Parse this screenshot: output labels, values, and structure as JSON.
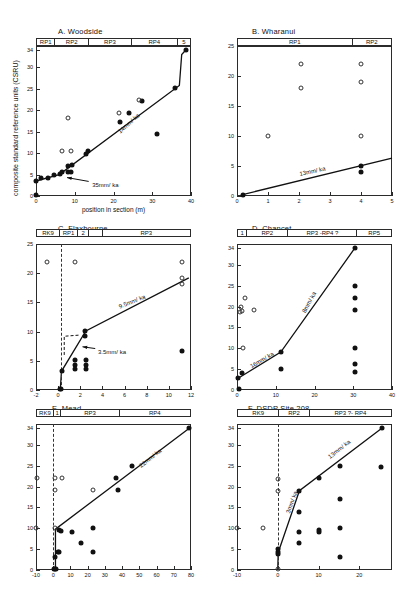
{
  "figure": {
    "axis": {
      "ylabel": "composite standard reference units (CSRU)",
      "xlabel": "position in section  (m)"
    }
  },
  "panels": [
    {
      "id": "A",
      "title": "A.  Woodside",
      "zones": [
        {
          "label": "RP1",
          "w": 12
        },
        {
          "label": "RP2",
          "w": 22
        },
        {
          "label": "RP3",
          "w": 28
        },
        {
          "label": "RP4",
          "w": 30
        },
        {
          "label": "5",
          "w": 8
        }
      ],
      "xlim": [
        0,
        40
      ],
      "ylim": [
        0,
        35
      ],
      "xticks": [
        0,
        10,
        20,
        30,
        40
      ],
      "yticks": [
        0,
        5,
        10,
        15,
        20,
        25,
        30,
        34
      ],
      "ytick_labels": [
        "0",
        "5",
        "10",
        "15",
        "20",
        "25",
        "30",
        "34"
      ],
      "rates": [
        {
          "label": "14mm/ ka",
          "x": 21,
          "y": 15.5,
          "rot": -42
        },
        {
          "label": "35mm/ ka",
          "x": 14.5,
          "y": 3.2,
          "rot": 0
        }
      ],
      "arrow": {
        "from": [
          13.6,
          3.4
        ],
        "to": [
          8.0,
          4.3
        ]
      },
      "fit": [
        [
          0,
          3.5
        ],
        [
          6,
          5.0
        ],
        [
          37,
          25.8
        ],
        [
          37.6,
          33.0
        ],
        [
          38.6,
          34.0
        ]
      ],
      "solid": [
        [
          0,
          0.2
        ],
        [
          0,
          3.5
        ],
        [
          1.2,
          4.2
        ],
        [
          3.2,
          4.3
        ],
        [
          4.6,
          4.8
        ],
        [
          6.2,
          5.2
        ],
        [
          6.8,
          5.5
        ],
        [
          8.2,
          5.6
        ],
        [
          9.0,
          5.5
        ],
        [
          8.3,
          7.1
        ],
        [
          9.3,
          7.3
        ],
        [
          12.8,
          9.7
        ],
        [
          13.3,
          10.4
        ],
        [
          21.8,
          17.2
        ],
        [
          24.0,
          19.3
        ],
        [
          27.4,
          22.2
        ],
        [
          31.3,
          14.4
        ],
        [
          35.9,
          25.3
        ],
        [
          38.6,
          34.0
        ]
      ],
      "open": [
        [
          8.2,
          18.2
        ],
        [
          6.8,
          10.4
        ],
        [
          9.0,
          10.4
        ],
        [
          21.5,
          19.3
        ],
        [
          26.6,
          22.3
        ]
      ]
    },
    {
      "id": "B",
      "title": "B.  Wharanui",
      "zones": [
        {
          "label": "RP1",
          "w": 75
        },
        {
          "label": "RP2",
          "w": 25
        }
      ],
      "xlim": [
        0,
        5
      ],
      "ylim": [
        0,
        25
      ],
      "xticks": [
        0,
        1,
        2,
        3,
        4,
        5
      ],
      "yticks": [
        0,
        5,
        10,
        15,
        20,
        25
      ],
      "ytick_labels": [
        "0",
        "5",
        "10",
        "15",
        "20",
        "25"
      ],
      "rates": [
        {
          "label": "13mm/ ka",
          "x": 2.0,
          "y": 4.2,
          "rot": -12
        }
      ],
      "fit": [
        [
          0.15,
          0.2
        ],
        [
          5.0,
          6.3
        ]
      ],
      "solid": [
        [
          0.18,
          0.2
        ],
        [
          4.0,
          5.0
        ],
        [
          4.0,
          4.0
        ]
      ],
      "open": [
        [
          2.05,
          22.0
        ],
        [
          2.05,
          18.0
        ],
        [
          1.0,
          10.0
        ],
        [
          4.0,
          22.0
        ],
        [
          4.0,
          19.0
        ],
        [
          4.0,
          10.0
        ]
      ]
    },
    {
      "id": "C",
      "title": "C.  Flaxbourne",
      "zones": [
        {
          "label": "RK9",
          "w": 15
        },
        {
          "label": "RP1",
          "w": 12
        },
        {
          "label": "2",
          "w": 7
        },
        {
          "label": "",
          "w": 9
        },
        {
          "label": "RP3",
          "w": 57
        }
      ],
      "xlim": [
        -2,
        12
      ],
      "ylim": [
        0,
        25
      ],
      "xticks": [
        -2,
        0,
        2,
        4,
        6,
        8,
        10,
        12
      ],
      "yticks": [
        0,
        5,
        10,
        15,
        20,
        25
      ],
      "ytick_labels": [
        "0",
        "5",
        "10",
        "15",
        "20",
        "25"
      ],
      "rates": [
        {
          "label": "9.5mm/ ka",
          "x": 5.4,
          "y": 14.7,
          "rot": -22
        },
        {
          "label": "3.5mm/ ka",
          "x": 3.6,
          "y": 7.0,
          "rot": 0
        }
      ],
      "arrow": {
        "from": [
          3.35,
          7.1
        ],
        "to": [
          2.2,
          7.4
        ]
      },
      "dashline_x": 0.25,
      "fit": [
        [
          0.2,
          0.2
        ],
        [
          0.3,
          3.2
        ],
        [
          2.5,
          10.1
        ],
        [
          11.8,
          19.2
        ]
      ],
      "dashed_seg": [
        [
          0.55,
          6.0
        ],
        [
          0.55,
          9.2
        ],
        [
          1.9,
          9.4
        ]
      ],
      "solid": [
        [
          0.2,
          0.2
        ],
        [
          0.3,
          0.2
        ],
        [
          0.35,
          3.2
        ],
        [
          1.5,
          5.1
        ],
        [
          1.5,
          4.3
        ],
        [
          2.5,
          5.1
        ],
        [
          2.5,
          4.3
        ],
        [
          2.5,
          3.6
        ],
        [
          1.5,
          3.6
        ],
        [
          2.45,
          10.1
        ],
        [
          2.45,
          9.2
        ],
        [
          11.2,
          6.6
        ]
      ],
      "open": [
        [
          -1.0,
          22.0
        ],
        [
          1.5,
          22.0
        ],
        [
          11.2,
          22.0
        ],
        [
          11.2,
          19.2
        ],
        [
          11.2,
          18.2
        ]
      ]
    },
    {
      "id": "D",
      "title": "D.  Chancet",
      "zones": [
        {
          "label": "1",
          "w": 6
        },
        {
          "label": "RP2",
          "w": 27
        },
        {
          "label": "RP3 -RP4 ?",
          "w": 45
        },
        {
          "label": "RP5",
          "w": 22
        }
      ],
      "xlim": [
        0,
        40
      ],
      "ylim": [
        0,
        35
      ],
      "xticks": [
        0,
        10,
        20,
        30,
        40
      ],
      "yticks": [
        0,
        5,
        10,
        15,
        20,
        25,
        30,
        34
      ],
      "ytick_labels": [
        "0",
        "5",
        "10",
        "15",
        "20",
        "25",
        "30",
        "34"
      ],
      "rates": [
        {
          "label": "8mm/ ka",
          "x": 16.5,
          "y": 19.0,
          "rot": -62
        },
        {
          "label": "16mm/ ka",
          "x": 3.0,
          "y": 6.2,
          "rot": -30
        }
      ],
      "fit": [
        [
          0.3,
          2.8
        ],
        [
          11.3,
          9.1
        ],
        [
          30.4,
          34.0
        ]
      ],
      "solid": [
        [
          0.3,
          2.8
        ],
        [
          0.4,
          0.2
        ],
        [
          1.3,
          4.0
        ],
        [
          11.3,
          9.1
        ],
        [
          11.3,
          5.0
        ],
        [
          30.4,
          34.0
        ],
        [
          30.4,
          25.0
        ],
        [
          30.4,
          22.0
        ],
        [
          30.4,
          19.1
        ],
        [
          30.4,
          10.0
        ],
        [
          30.4,
          6.3
        ],
        [
          30.4,
          4.2
        ]
      ],
      "open": [
        [
          2.0,
          22.0
        ],
        [
          1.0,
          20.0
        ],
        [
          1.4,
          19.0
        ],
        [
          0.9,
          18.8
        ],
        [
          4.3,
          19.2
        ],
        [
          1.6,
          10.0
        ]
      ]
    },
    {
      "id": "E",
      "title": "E.  Mead",
      "zones": [
        {
          "label": "RK9",
          "w": 11
        },
        {
          "label": "1",
          "w": 5
        },
        {
          "label": "RP3",
          "w": 38
        },
        {
          "label": "RP4",
          "w": 46
        }
      ],
      "xlim": [
        -10,
        80
      ],
      "ylim": [
        0,
        35
      ],
      "xticks": [
        -10,
        0,
        10,
        20,
        30,
        40,
        50,
        60,
        70,
        80
      ],
      "yticks": [
        0,
        5,
        10,
        15,
        20,
        25,
        30,
        34
      ],
      "ytick_labels": [
        "0",
        "5",
        "10",
        "15",
        "20",
        "25",
        "30",
        "34"
      ],
      "rates": [
        {
          "label": "22mm/ ka",
          "x": 49,
          "y": 25.5,
          "rot": -38
        }
      ],
      "dashline_x": 0.0,
      "fit": [
        [
          1.3,
          0.2
        ],
        [
          1.3,
          9.8
        ],
        [
          79.0,
          34.0
        ]
      ],
      "solid": [
        [
          0.5,
          0.2
        ],
        [
          1.0,
          0.2
        ],
        [
          1.5,
          0.3
        ],
        [
          1.3,
          3.2
        ],
        [
          2.6,
          4.3
        ],
        [
          3.3,
          4.4
        ],
        [
          3.6,
          9.5
        ],
        [
          4.6,
          9.4
        ],
        [
          11.0,
          9.1
        ],
        [
          16.0,
          6.5
        ],
        [
          23.0,
          10.0
        ],
        [
          23.0,
          4.2
        ],
        [
          36.5,
          22.1
        ],
        [
          37.5,
          19.2
        ],
        [
          45.5,
          25.0
        ],
        [
          79.0,
          34.0
        ]
      ],
      "open": [
        [
          -10.0,
          10.0
        ],
        [
          -9.5,
          22.0
        ],
        [
          1.3,
          22.0
        ],
        [
          5.0,
          22.0
        ],
        [
          1.3,
          19.2
        ],
        [
          1.3,
          10.0
        ],
        [
          23.0,
          19.2
        ]
      ]
    },
    {
      "id": "F",
      "title": "F. DSDP Site  208",
      "zones": [
        {
          "label": "RK9",
          "w": 27
        },
        {
          "label": "RP2",
          "w": 20
        },
        {
          "label": "RP3 ?- RP4",
          "w": 53
        }
      ],
      "xlim": [
        -10,
        28
      ],
      "ylim": [
        0,
        35
      ],
      "xticks": [
        -10,
        0,
        10,
        20
      ],
      "yticks": [
        0,
        5,
        10,
        15,
        20,
        25,
        30,
        34
      ],
      "ytick_labels": [
        "0",
        "5",
        "10",
        "15",
        "20",
        "25",
        "30",
        "34"
      ],
      "rates": [
        {
          "label": "13mm/ ka",
          "x": 12.0,
          "y": 27.5,
          "rot": -38
        },
        {
          "label": "3mm/ ka",
          "x": 1.7,
          "y": 14.0,
          "rot": -70
        }
      ],
      "dashline_x": 0.0,
      "fit": [
        [
          0.0,
          0.2
        ],
        [
          0.1,
          4.2
        ],
        [
          5.3,
          19.0
        ],
        [
          25.5,
          34.0
        ]
      ],
      "solid": [
        [
          0.1,
          5.0
        ],
        [
          0.1,
          4.2
        ],
        [
          0.1,
          3.8
        ],
        [
          5.3,
          19.0
        ],
        [
          5.3,
          14.0
        ],
        [
          5.3,
          9.2
        ],
        [
          5.3,
          6.5
        ],
        [
          10.2,
          22.0
        ],
        [
          10.2,
          9.5
        ],
        [
          10.2,
          9.1
        ],
        [
          15.2,
          24.9
        ],
        [
          15.2,
          17.0
        ],
        [
          15.2,
          10.0
        ],
        [
          15.2,
          3.0
        ],
        [
          25.3,
          24.8
        ],
        [
          25.5,
          34.0
        ]
      ],
      "open": [
        [
          0.1,
          21.8
        ],
        [
          0.1,
          19.0
        ],
        [
          0.0,
          0.2
        ],
        [
          -10.0,
          10.0
        ],
        [
          -3.6,
          10.0
        ]
      ]
    }
  ]
}
